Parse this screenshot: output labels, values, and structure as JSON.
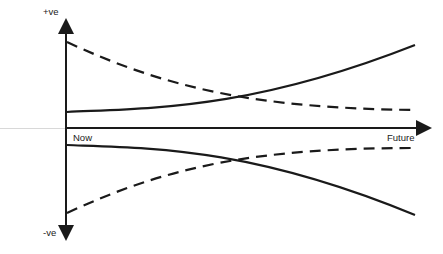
{
  "diagram": {
    "axes": {
      "y_top_label": "+ve",
      "y_bottom_label": "-ve",
      "x_start_label": "Now",
      "x_end_label": "Future"
    },
    "curves": [
      {
        "name": "upper-solid",
        "style": "solid",
        "description": "rises from slightly positive to strongly positive"
      },
      {
        "name": "upper-dashed",
        "style": "dashed",
        "description": "falls from strongly positive to slightly positive"
      },
      {
        "name": "lower-solid",
        "style": "solid",
        "description": "falls from slightly negative to strongly negative"
      },
      {
        "name": "lower-dashed",
        "style": "dashed",
        "description": "rises from strongly negative to slightly negative"
      }
    ],
    "colors": {
      "line": "#1a1a1a",
      "background": "#ffffff",
      "faint_text": "#ececec"
    }
  }
}
